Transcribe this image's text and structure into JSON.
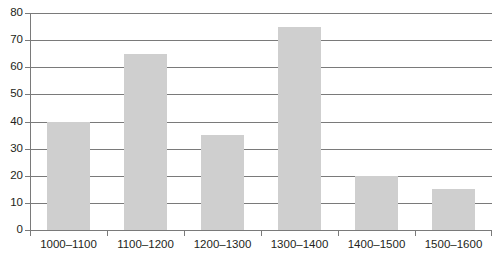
{
  "chart_data": {
    "type": "bar",
    "title": "",
    "subtitle": "",
    "xlabel": "",
    "ylabel": "",
    "categories": [
      "1000–1100",
      "1100–1200",
      "1200–1300",
      "1300–1400",
      "1400–1500",
      "1500–1600"
    ],
    "values": [
      40,
      65,
      35,
      75,
      20,
      15
    ],
    "series": [
      {
        "name": "",
        "values": [
          40,
          65,
          35,
          75,
          20,
          15
        ]
      }
    ],
    "ylim": [
      0,
      80
    ],
    "y_ticks": [
      0,
      10,
      20,
      30,
      40,
      50,
      60,
      70,
      80
    ],
    "y_tick_labels": [
      "0",
      "10",
      "20",
      "30",
      "40",
      "50",
      "60",
      "70",
      "80"
    ],
    "grid": true,
    "grid_axis": "y",
    "legend": false,
    "legend_position": "none",
    "annotations": [],
    "colors": {
      "bar_fill": "#cfcfcf",
      "gridline": "#7a7a7a",
      "axis": "#7a7a7a",
      "text": "#231f20",
      "background": "#ffffff"
    }
  }
}
